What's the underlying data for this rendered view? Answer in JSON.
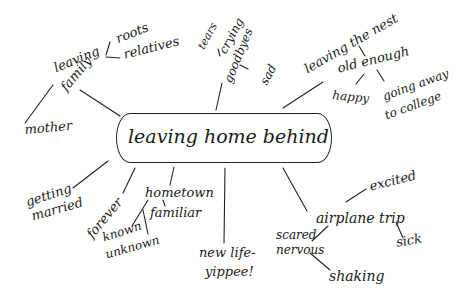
{
  "diagram": {
    "type": "mind-map",
    "style": "hand-drawn",
    "ink_color": "#1a1a1a",
    "background": "#ffffff",
    "center": {
      "label": "leaving home behind"
    },
    "branches": [
      {
        "label": "leaving family",
        "label_lines": [
          "leaving",
          "family"
        ],
        "children": [
          {
            "label": "roots"
          },
          {
            "label": "relatives"
          },
          {
            "label": "mother"
          }
        ]
      },
      {
        "label": "goodbyes",
        "children": [
          {
            "label": "tears"
          },
          {
            "label": "crying"
          },
          {
            "label": "sad"
          }
        ]
      },
      {
        "label": "leaving the nest",
        "children": [
          {
            "label": "old enough",
            "children": [
              {
                "label": "happy"
              },
              {
                "label": "going away to college",
                "label_lines": [
                  "going away",
                  "to college"
                ]
              }
            ]
          }
        ]
      },
      {
        "label": "getting married",
        "label_lines": [
          "getting",
          "married"
        ]
      },
      {
        "label": "forever"
      },
      {
        "label": "hometown",
        "children": [
          {
            "label": "familiar"
          },
          {
            "label": "known unknown",
            "label_lines": [
              "known",
              "unknown"
            ]
          }
        ]
      },
      {
        "label": "new life- yippee!",
        "label_lines": [
          "new life-",
          "yippee!"
        ]
      },
      {
        "label": "airplane trip",
        "children": [
          {
            "label": "excited"
          },
          {
            "label": "sick"
          },
          {
            "label": "scared nervous",
            "label_lines": [
              "scared",
              "nervous"
            ],
            "children": [
              {
                "label": "shaking"
              }
            ]
          }
        ]
      }
    ]
  }
}
